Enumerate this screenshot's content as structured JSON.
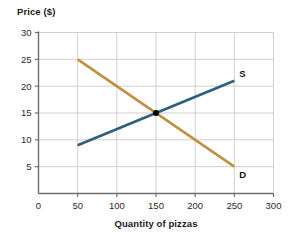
{
  "chart_data": {
    "type": "line",
    "title": "",
    "xlabel": "Quantity of pizzas",
    "ylabel": "Price ($)",
    "xlim": [
      0,
      300
    ],
    "ylim": [
      0,
      30
    ],
    "xticks": [
      "0",
      "50",
      "100",
      "150",
      "200",
      "250",
      "300"
    ],
    "xtick_values": [
      0,
      50,
      100,
      150,
      200,
      250,
      300
    ],
    "yticks": [
      "5",
      "10",
      "15",
      "20",
      "25",
      "30"
    ],
    "ytick_values": [
      5,
      10,
      15,
      20,
      25,
      30
    ],
    "grid": "both",
    "legend": "inline-end-labels",
    "series": [
      {
        "name": "S",
        "label": "S",
        "description": "Supply curve",
        "color": "#2e5f7d",
        "x": [
          50,
          250
        ],
        "values": [
          9,
          21
        ]
      },
      {
        "name": "D",
        "label": "D",
        "description": "Demand curve",
        "color": "#c08f42",
        "x": [
          50,
          250
        ],
        "values": [
          25,
          5
        ]
      }
    ],
    "annotations": [
      {
        "name": "equilibrium-point",
        "label": "",
        "x": 150,
        "y": 15,
        "color": "#000000"
      }
    ]
  },
  "axes": {
    "y_title": "Price ($)",
    "x_title": "Quantity of pizzas"
  },
  "colors": {
    "supply": "#2e5f7d",
    "demand": "#c08f42",
    "grid": "#cfcfcf",
    "axis": "#6e6e6e",
    "equilibrium": "#000000",
    "background": "#ffffff"
  }
}
